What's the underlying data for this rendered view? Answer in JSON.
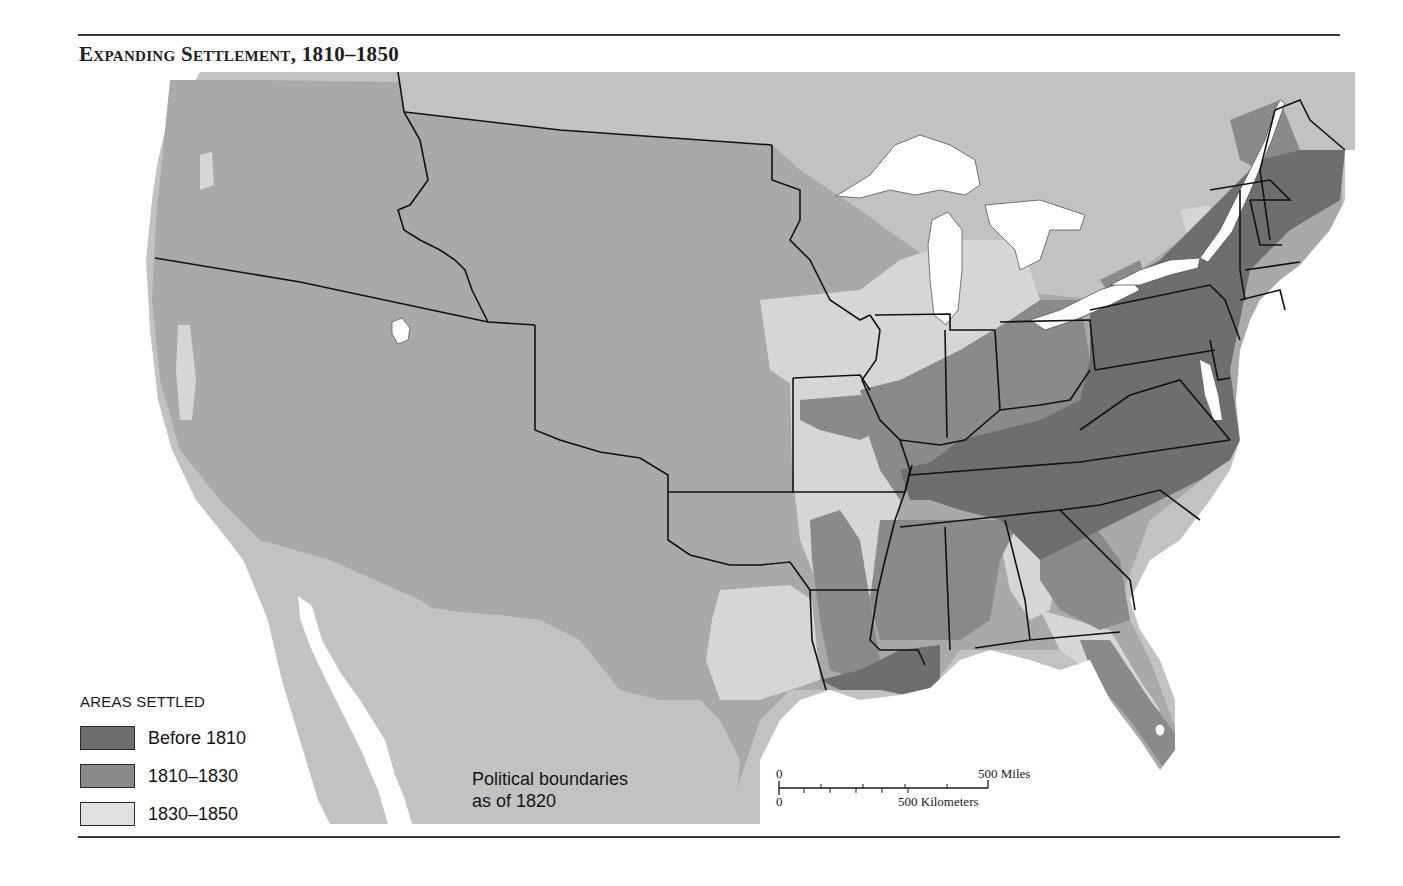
{
  "header": {
    "title": "Expanding Settlement, 1810–1850"
  },
  "legend": {
    "title": "AREAS SETTLED",
    "items": [
      {
        "label": "Before 1810",
        "color": "#6e6e6e"
      },
      {
        "label": "1810–1830",
        "color": "#8a8a8a"
      },
      {
        "label": "1830–1850",
        "color": "#d6d6d6"
      }
    ]
  },
  "map": {
    "unsettled_color": "#a9a9a9",
    "foreign_color": "#c2c2c2",
    "water_color": "#ffffff",
    "boundary_color": "#111111",
    "note_line1": "Political boundaries",
    "note_line2": "as of 1820"
  },
  "scale_bar": {
    "miles_zero": "0",
    "miles_label": "500 Miles",
    "km_zero": "0",
    "km_label": "500 Kilometers"
  }
}
